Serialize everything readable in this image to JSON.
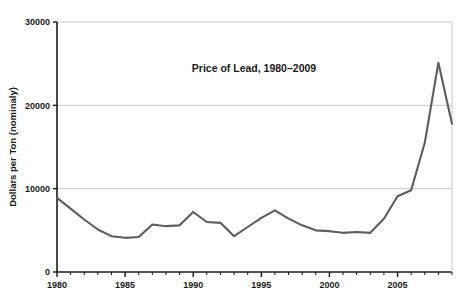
{
  "chart_data": {
    "type": "line",
    "title": "Price of Lead, 1980–2009",
    "xlabel": "",
    "ylabel": "Dollars per Ton (nominaly)",
    "xlim": [
      1980,
      2009
    ],
    "ylim": [
      0,
      30000
    ],
    "grid": "horizontal",
    "legend": "none",
    "line_color": "#5d5d5d",
    "axis_color": "#1a1a1a",
    "gridline_color": "#c9c9c9",
    "background_color": "#ffffff",
    "y_ticks": [
      0,
      10000,
      20000,
      30000
    ],
    "y_tick_labels": [
      "0",
      "10000",
      "20000",
      "30000"
    ],
    "x_ticks": [
      1980,
      1985,
      1990,
      1995,
      2000,
      2005
    ],
    "x_tick_labels": [
      "1980",
      "1985",
      "1990",
      "1995",
      "2000",
      "2005"
    ],
    "x_minor_tick_interval": 1,
    "x": [
      1980,
      1981,
      1982,
      1983,
      1984,
      1985,
      1986,
      1987,
      1988,
      1989,
      1990,
      1991,
      1992,
      1993,
      1994,
      1995,
      1996,
      1997,
      1998,
      1999,
      2000,
      2001,
      2002,
      2003,
      2004,
      2005,
      2006,
      2007,
      2008,
      2009
    ],
    "values": [
      8900,
      7600,
      6300,
      5100,
      4300,
      4100,
      4200,
      5700,
      5500,
      5600,
      7200,
      6000,
      5900,
      4300,
      5400,
      6500,
      7400,
      6400,
      5600,
      5000,
      4900,
      4700,
      4800,
      4700,
      6400,
      9100,
      9800,
      15500,
      25100,
      17800
    ],
    "series": [
      {
        "name": "Price of Lead",
        "values": [
          8900,
          7600,
          6300,
          5100,
          4300,
          4100,
          4200,
          5700,
          5500,
          5600,
          7200,
          6000,
          5900,
          4300,
          5400,
          6500,
          7400,
          6400,
          5600,
          5000,
          4900,
          4700,
          4800,
          4700,
          6400,
          9100,
          9800,
          15500,
          25100,
          17800
        ]
      }
    ],
    "annotations": []
  }
}
